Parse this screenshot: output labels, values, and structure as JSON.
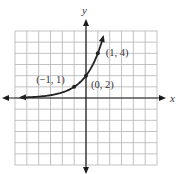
{
  "chart_data": {
    "type": "line",
    "title": "",
    "function": "f(x) = 2^(x+1)",
    "xlabel": "x",
    "ylabel": "y",
    "xlim": [
      -6,
      6
    ],
    "ylim": [
      -6,
      6
    ],
    "grid": true,
    "grid_step": 1,
    "curve_domain": [
      -5.5,
      1.45
    ],
    "curve_arrows": [
      "left",
      "top"
    ],
    "axis_arrows": true,
    "series": [
      {
        "name": "exponential curve",
        "points": [
          {
            "x": -1,
            "y": 1,
            "label": "(−1, 1)"
          },
          {
            "x": 0,
            "y": 2,
            "label": "(0, 2)"
          },
          {
            "x": 1,
            "y": 4,
            "label": "(1, 4)"
          }
        ]
      }
    ],
    "colors": {
      "grid": "#b4b4b4",
      "axis": "#1a1a1a",
      "curve": "#222222",
      "text": "#333333"
    }
  }
}
